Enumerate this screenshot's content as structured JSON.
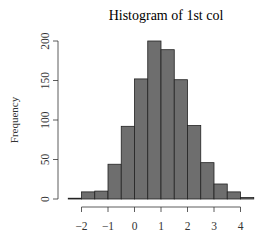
{
  "chart_data": {
    "type": "bar",
    "title": "Histogram of 1st col",
    "xlabel": "",
    "ylabel": "Frequency",
    "bin_edges": [
      -2.5,
      -2.0,
      -1.5,
      -1.0,
      -0.5,
      0.0,
      0.5,
      1.0,
      1.5,
      2.0,
      2.5,
      3.0,
      3.5,
      4.0,
      4.5
    ],
    "categories": [
      "[-2.5,-2)",
      "[-2,-1.5)",
      "[-1.5,-1)",
      "[-1,-0.5)",
      "[-0.5,0)",
      "[0,0.5)",
      "[0.5,1)",
      "[1,1.5)",
      "[1.5,2)",
      "[2,2.5)",
      "[2.5,3)",
      "[3,3.5)",
      "[3.5,4)",
      "[4,4.5)"
    ],
    "values": [
      1,
      9,
      10,
      44,
      92,
      152,
      200,
      189,
      151,
      93,
      46,
      19,
      9,
      2
    ],
    "x_ticks": [
      -2,
      -1,
      0,
      1,
      2,
      3,
      4
    ],
    "x_tick_labels": [
      "−2",
      "−1",
      "0",
      "1",
      "2",
      "3",
      "4"
    ],
    "y_ticks": [
      0,
      50,
      100,
      150,
      200
    ],
    "y_tick_labels": [
      "0",
      "50",
      "100",
      "150",
      "200"
    ],
    "xlim": [
      -2.5,
      4.5
    ],
    "ylim": [
      0,
      200
    ],
    "grid": false,
    "legend": null,
    "bar_color": "#6e6e6e",
    "bar_edge_color": "#222222"
  }
}
